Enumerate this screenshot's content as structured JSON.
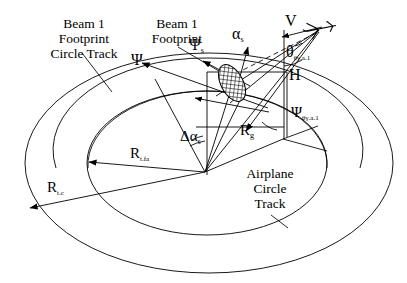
{
  "figure": {
    "kind": "geometry-diagram",
    "title_visible": false,
    "background_color": "#ffffff",
    "line_color": "#000000",
    "width": 407,
    "height": 283
  },
  "labels": {
    "beam1_footprint_circle_track": "Beam 1\nFootprint\nCircle Track",
    "beam1_footprint_circle_track_lines": [
      "Beam 1",
      "Footprint",
      "Circle Track"
    ],
    "beam1_footprint": "Beam 1\nFootprint",
    "beam1_footprint_lines": [
      "Beam 1",
      "Footprint"
    ],
    "airplane_circle_track": "Airplane\nCircle\nTrack",
    "airplane_circle_track_lines": [
      "Airplane",
      "Circle",
      "Track"
    ],
    "psi": "Ψ",
    "psi_s_base": "Ψ",
    "psi_s_sub": "s",
    "alpha_s_base": "α",
    "alpha_s_sub": "s",
    "velocity": "V",
    "theta_base": "θ",
    "theta_sub": "θγ.a.1",
    "altitude": "H",
    "psi_theta_base": "Ψ",
    "psi_theta_sub": "θγ.a.1",
    "delta_alpha_s_base": "Δα",
    "delta_alpha_s_sub": "s",
    "r_g_base": "R",
    "r_g_sub": "g",
    "r_tfa_base": "R",
    "r_tfa_sub": "t.fa",
    "r_tc_base": "R",
    "r_tc_sub": "t.c"
  },
  "icons": {
    "airplane": "airplane-icon",
    "footprint_ellipse": "beam-footprint-hatched-ellipse-icon"
  },
  "geometry": {
    "outer_ellipse": {
      "cx": 209,
      "cy": 163,
      "rx": 184,
      "ry": 110
    },
    "inner_ellipse": {
      "cx": 207,
      "cy": 163,
      "rx": 120,
      "ry": 72
    },
    "footprint_track_ellipse": {
      "cx": 208,
      "cy": 150,
      "rx": 152,
      "ry": 92
    },
    "airplane_track_ellipse": {
      "cx": 207,
      "cy": 163,
      "rx": 120,
      "ry": 72
    },
    "circle_center": {
      "x": 205,
      "y": 172
    },
    "airplane_position": {
      "x": 320,
      "y": 28
    },
    "ground_point_below_airplane": {
      "x": 283,
      "y": 139
    },
    "footprint_position": {
      "x": 240,
      "y": 78
    }
  }
}
